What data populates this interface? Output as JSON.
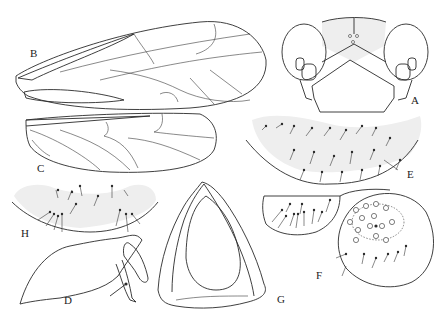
{
  "figure": {
    "type": "morphology-plate",
    "panels": [
      {
        "id": "A",
        "label": "A",
        "subject": "head, frontal view"
      },
      {
        "id": "B",
        "label": "B",
        "subject": "forewing"
      },
      {
        "id": "C",
        "label": "C",
        "subject": "hindwing"
      },
      {
        "id": "D",
        "label": "D",
        "subject": "appendage, lateral view"
      },
      {
        "id": "E",
        "label": "E",
        "subject": "sternite with setae"
      },
      {
        "id": "F",
        "label": "F",
        "subject": "terminal segment with setae and pores"
      },
      {
        "id": "G",
        "label": "G",
        "subject": "sclerite, ventral view"
      },
      {
        "id": "H",
        "label": "H",
        "subject": "sternite with setae"
      }
    ]
  },
  "colors": {
    "line": "#2a2a2a",
    "stipple": "#eeeeee",
    "background": "#ffffff"
  }
}
